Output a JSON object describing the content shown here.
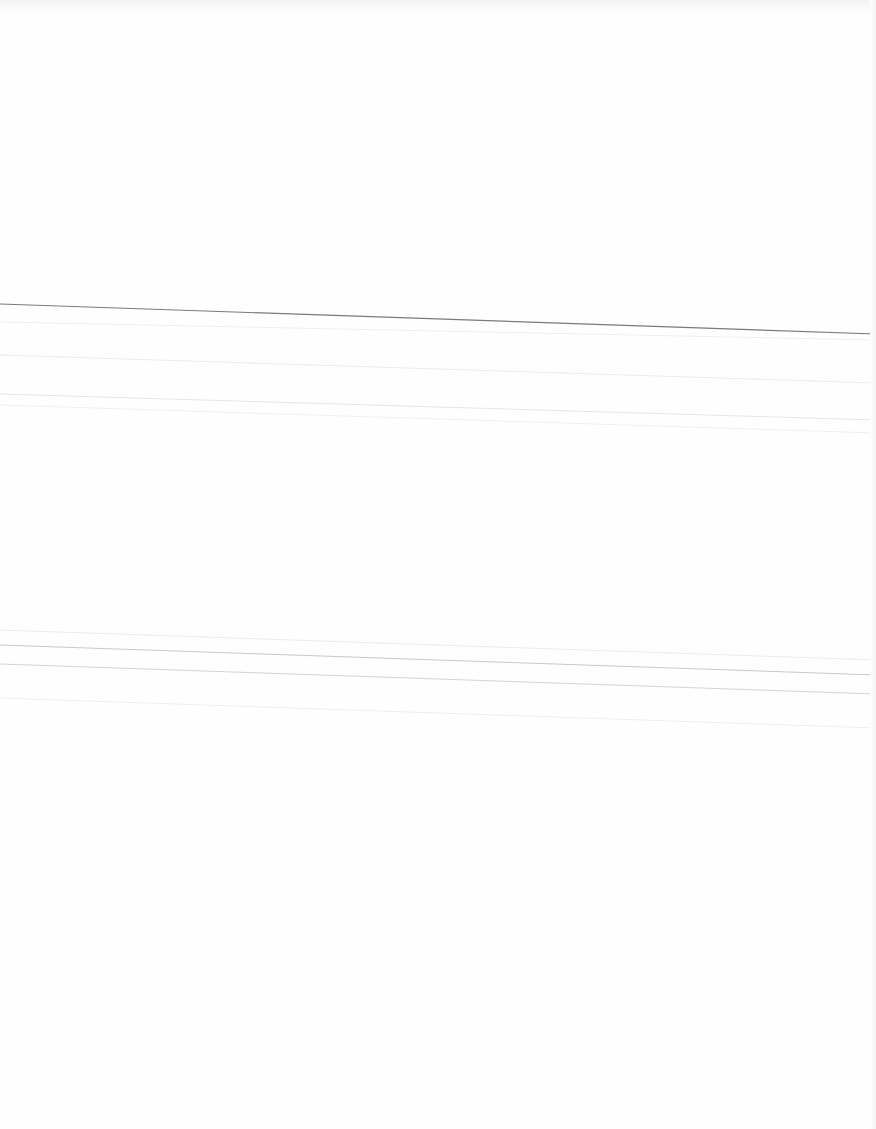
{
  "document": {
    "type": "blank scanned page",
    "text": "",
    "rules": [
      {
        "x1": 0,
        "y1": 304,
        "x2": 876,
        "y2": 334,
        "color": "#7a7a7a",
        "width": 1.2
      },
      {
        "x1": 0,
        "y1": 322,
        "x2": 876,
        "y2": 340,
        "color": "#eeeeee",
        "width": 1
      },
      {
        "x1": 0,
        "y1": 355,
        "x2": 876,
        "y2": 383,
        "color": "#ececec",
        "width": 1
      },
      {
        "x1": 0,
        "y1": 394,
        "x2": 876,
        "y2": 420,
        "color": "#e6e6e6",
        "width": 1
      },
      {
        "x1": 0,
        "y1": 405,
        "x2": 876,
        "y2": 433,
        "color": "#efefef",
        "width": 1
      },
      {
        "x1": 0,
        "y1": 630,
        "x2": 876,
        "y2": 660,
        "color": "#ececec",
        "width": 1
      },
      {
        "x1": 0,
        "y1": 645,
        "x2": 876,
        "y2": 675,
        "color": "#c9c9c9",
        "width": 1
      },
      {
        "x1": 0,
        "y1": 664,
        "x2": 876,
        "y2": 694,
        "color": "#d4d4d4",
        "width": 1
      },
      {
        "x1": 0,
        "y1": 698,
        "x2": 876,
        "y2": 728,
        "color": "#eeeeee",
        "width": 1
      }
    ]
  }
}
